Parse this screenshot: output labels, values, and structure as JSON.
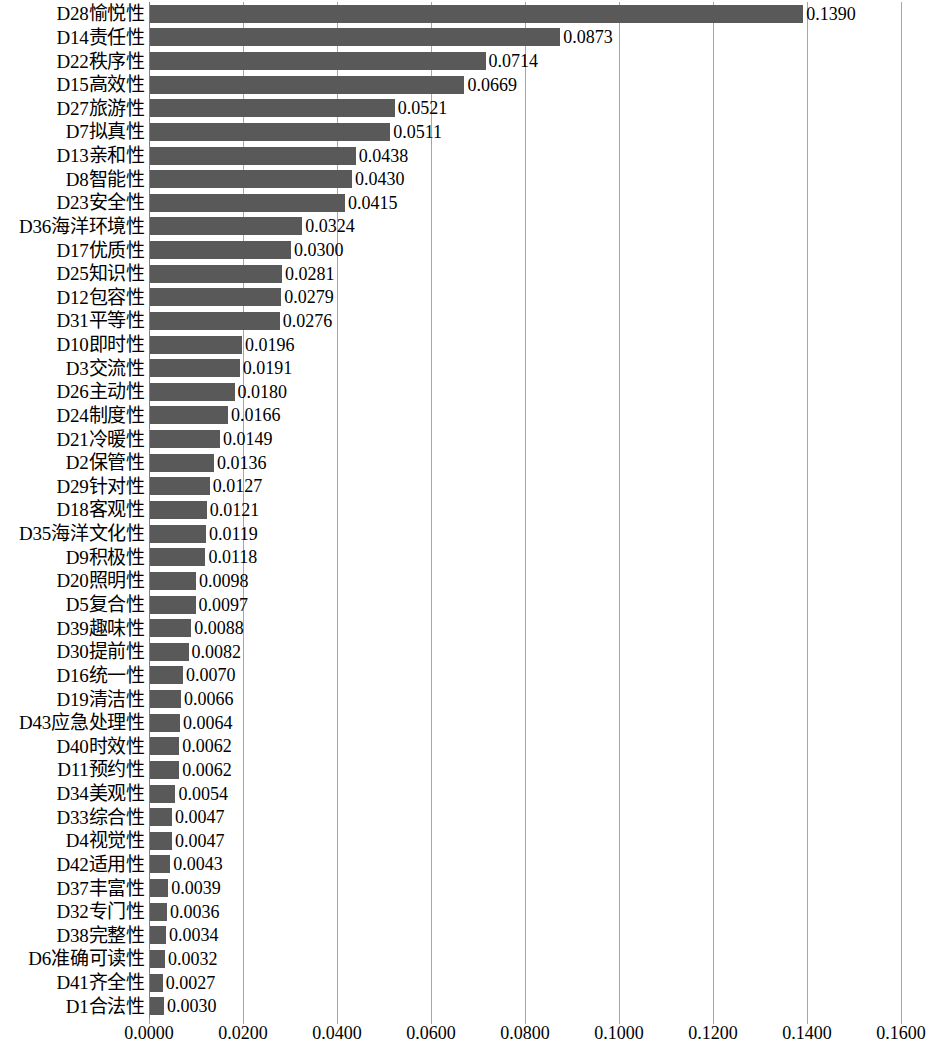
{
  "chart_data": {
    "type": "bar",
    "orientation": "horizontal",
    "title": "",
    "subtitle": "",
    "xlabel": "",
    "ylabel": "",
    "xlim": [
      0.0,
      0.16
    ],
    "xticks": [
      "0.0000",
      "0.0200",
      "0.0400",
      "0.0600",
      "0.0800",
      "0.1000",
      "0.1200",
      "0.1400",
      "0.1600"
    ],
    "xtick_values": [
      0.0,
      0.02,
      0.04,
      0.06,
      0.08,
      0.1,
      0.12,
      0.14,
      0.16
    ],
    "grid": "vertical",
    "legend": "none",
    "bar_color": "#595959",
    "gridline_color": "#A6A6A6",
    "categories": [
      "D28愉悦性",
      "D14责任性",
      "D22秩序性",
      "D15高效性",
      "D27旅游性",
      "D7拟真性",
      "D13亲和性",
      "D8智能性",
      "D23安全性",
      "D36海洋环境性",
      "D17优质性",
      "D25知识性",
      "D12包容性",
      "D31平等性",
      "D10即时性",
      "D3交流性",
      "D26主动性",
      "D24制度性",
      "D21冷暖性",
      "D2保管性",
      "D29针对性",
      "D18客观性",
      "D35海洋文化性",
      "D9积极性",
      "D20照明性",
      "D5复合性",
      "D39趣味性",
      "D30提前性",
      "D16统一性",
      "D19清洁性",
      "D43应急处理性",
      "D40时效性",
      "D11预约性",
      "D34美观性",
      "D33综合性",
      "D4视觉性",
      "D42适用性",
      "D37丰富性",
      "D32专门性",
      "D38完整性",
      "D6准确可读性",
      "D41齐全性",
      "D1合法性"
    ],
    "values": [
      0.139,
      0.0873,
      0.0714,
      0.0669,
      0.0521,
      0.0511,
      0.0438,
      0.043,
      0.0415,
      0.0324,
      0.03,
      0.0281,
      0.0279,
      0.0276,
      0.0196,
      0.0191,
      0.018,
      0.0166,
      0.0149,
      0.0136,
      0.0127,
      0.0121,
      0.0119,
      0.0118,
      0.0098,
      0.0097,
      0.0088,
      0.0082,
      0.007,
      0.0066,
      0.0064,
      0.0062,
      0.0062,
      0.0054,
      0.0047,
      0.0047,
      0.0043,
      0.0039,
      0.0036,
      0.0034,
      0.0032,
      0.0027,
      0.003
    ],
    "value_labels": [
      "0.1390",
      "0.0873",
      "0.0714",
      "0.0669",
      "0.0521",
      "0.0511",
      "0.0438",
      "0.0430",
      "0.0415",
      "0.0324",
      "0.0300",
      "0.0281",
      "0.0279",
      "0.0276",
      "0.0196",
      "0.0191",
      "0.0180",
      "0.0166",
      "0.0149",
      "0.0136",
      "0.0127",
      "0.0121",
      "0.0119",
      "0.0118",
      "0.0098",
      "0.0097",
      "0.0088",
      "0.0082",
      "0.0070",
      "0.0066",
      "0.0064",
      "0.0062",
      "0.0062",
      "0.0054",
      "0.0047",
      "0.0047",
      "0.0043",
      "0.0039",
      "0.0036",
      "0.0034",
      "0.0032",
      "0.0027",
      "0.0030"
    ]
  }
}
